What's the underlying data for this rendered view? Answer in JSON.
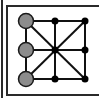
{
  "game": {
    "name": "three-in-a-row board",
    "board": {
      "rows": 3,
      "cols": 3,
      "line_color": "#111111",
      "frame_color": "#2a2a2a",
      "grid_x": [
        26,
        55,
        85
      ],
      "grid_y": [
        21,
        50,
        79
      ],
      "diagonals": true
    },
    "pieces": [
      {
        "row": 0,
        "col": 0,
        "color": "#8c8c8c",
        "type": "player-piece"
      },
      {
        "row": 1,
        "col": 0,
        "color": "#8c8c8c",
        "type": "player-piece"
      },
      {
        "row": 2,
        "col": 0,
        "color": "#8c8c8c",
        "type": "player-piece"
      }
    ],
    "empty_points": [
      {
        "row": 0,
        "col": 1
      },
      {
        "row": 0,
        "col": 2
      },
      {
        "row": 1,
        "col": 1
      },
      {
        "row": 1,
        "col": 2
      },
      {
        "row": 2,
        "col": 1
      },
      {
        "row": 2,
        "col": 2
      }
    ]
  }
}
